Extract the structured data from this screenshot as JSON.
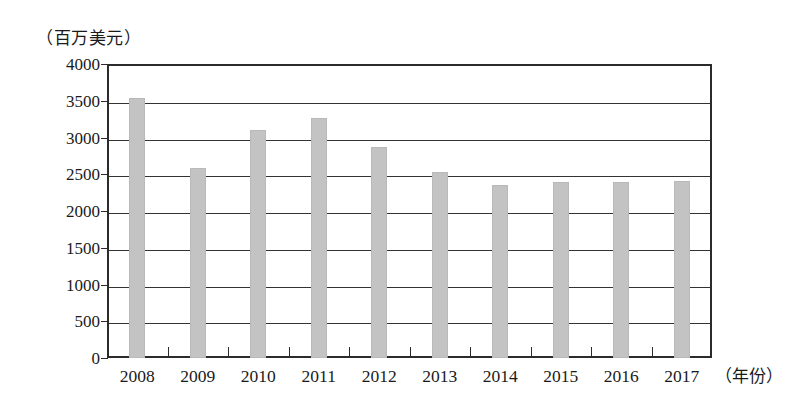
{
  "chart_data": {
    "type": "bar",
    "title": "",
    "subtitle": "",
    "xlabel": "（年份）",
    "ylabel": "（百万美元）",
    "categories": [
      "2008",
      "2009",
      "2010",
      "2011",
      "2012",
      "2013",
      "2014",
      "2015",
      "2016",
      "2017"
    ],
    "values": [
      3540,
      2590,
      3100,
      3260,
      2870,
      2530,
      2350,
      2400,
      2390,
      2410
    ],
    "series": [
      {
        "name": "",
        "values": [
          3540,
          2590,
          3100,
          3260,
          2870,
          2530,
          2350,
          2400,
          2390,
          2410
        ]
      }
    ],
    "ylim": [
      0,
      4000
    ],
    "ytick_interval": 500,
    "yticks": [
      "4000",
      "3500",
      "3000",
      "2500",
      "2000",
      "1500",
      "1000",
      "500",
      "0"
    ],
    "ytick_values": [
      4000,
      3500,
      3000,
      2500,
      2000,
      1500,
      1000,
      500,
      0
    ],
    "grid": true,
    "grid_axis": "y",
    "legend": false,
    "legend_position": "none",
    "bar_color": "#c3c3c3",
    "axis_color": "#2b2b2b",
    "background_color": "#ffffff",
    "annotations": []
  },
  "axes": {
    "y_unit_caption": "（百万美元）",
    "x_unit_caption": "（年份）"
  }
}
